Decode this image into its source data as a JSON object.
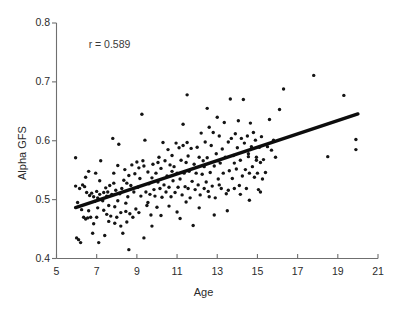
{
  "chart_data": {
    "type": "scatter",
    "title": "",
    "xlabel": "Age",
    "ylabel": "Alpha GFS",
    "xlim": [
      5,
      21
    ],
    "ylim": [
      0.4,
      0.8
    ],
    "xticks": [
      5,
      7,
      9,
      11,
      13,
      15,
      17,
      19,
      21
    ],
    "xtick_labels": [
      "5",
      "7",
      "9",
      "11",
      "13",
      "15",
      "17",
      "19",
      "21"
    ],
    "yticks": [
      0.4,
      0.5,
      0.6,
      0.7,
      0.8
    ],
    "ytick_labels": [
      "0.4",
      "0.5",
      "0.6",
      "0.7",
      "0.8"
    ],
    "grid": false,
    "legend": "none",
    "annotations": [
      {
        "text": "r = 0.589",
        "x": 6.6,
        "y": 0.762
      }
    ],
    "marker": {
      "shape": "circle",
      "color": "#141414",
      "size_px": 3.4
    },
    "trendline": {
      "type": "linear",
      "color": "#0d0d0d",
      "width_px": 3.4,
      "x_start": 5.95,
      "y_start": 0.4865,
      "x_end": 20.0,
      "y_end": 0.6455,
      "slope": 0.01131,
      "intercept": 0.4192
    },
    "spines": {
      "left": true,
      "bottom": true,
      "top": false,
      "right": false
    },
    "points": [
      [
        5.95,
        0.571
      ],
      [
        5.95,
        0.523
      ],
      [
        6.0,
        0.435
      ],
      [
        6.1,
        0.432
      ],
      [
        6.15,
        0.519
      ],
      [
        6.2,
        0.427
      ],
      [
        6.3,
        0.525
      ],
      [
        6.35,
        0.47
      ],
      [
        6.4,
        0.522
      ],
      [
        6.45,
        0.467
      ],
      [
        6.5,
        0.512
      ],
      [
        6.55,
        0.469
      ],
      [
        6.6,
        0.548
      ],
      [
        6.65,
        0.507
      ],
      [
        6.7,
        0.47
      ],
      [
        6.75,
        0.511
      ],
      [
        6.8,
        0.443
      ],
      [
        6.85,
        0.505
      ],
      [
        6.9,
        0.497
      ],
      [
        6.95,
        0.545
      ],
      [
        7.0,
        0.514
      ],
      [
        7.0,
        0.47
      ],
      [
        7.05,
        0.503
      ],
      [
        7.1,
        0.427
      ],
      [
        7.15,
        0.509
      ],
      [
        7.2,
        0.566
      ],
      [
        7.25,
        0.5
      ],
      [
        7.3,
        0.498
      ],
      [
        7.35,
        0.512
      ],
      [
        7.4,
        0.439
      ],
      [
        7.45,
        0.52
      ],
      [
        7.5,
        0.506
      ],
      [
        7.5,
        0.475
      ],
      [
        7.55,
        0.513
      ],
      [
        7.6,
        0.49
      ],
      [
        7.65,
        0.524
      ],
      [
        7.7,
        0.472
      ],
      [
        7.75,
        0.509
      ],
      [
        7.8,
        0.604
      ],
      [
        7.85,
        0.545
      ],
      [
        7.9,
        0.488
      ],
      [
        7.95,
        0.516
      ],
      [
        8.0,
        0.47
      ],
      [
        8.05,
        0.558
      ],
      [
        8.1,
        0.594
      ],
      [
        8.15,
        0.51
      ],
      [
        8.2,
        0.478
      ],
      [
        8.25,
        0.519
      ],
      [
        8.3,
        0.443
      ],
      [
        8.35,
        0.533
      ],
      [
        8.4,
        0.551
      ],
      [
        8.45,
        0.48
      ],
      [
        8.5,
        0.528
      ],
      [
        8.55,
        0.505
      ],
      [
        8.6,
        0.415
      ],
      [
        8.65,
        0.476
      ],
      [
        8.7,
        0.524
      ],
      [
        8.75,
        0.559
      ],
      [
        8.8,
        0.47
      ],
      [
        8.85,
        0.513
      ],
      [
        8.9,
        0.544
      ],
      [
        8.95,
        0.484
      ],
      [
        9.0,
        0.564
      ],
      [
        9.05,
        0.521
      ],
      [
        9.1,
        0.478
      ],
      [
        9.15,
        0.536
      ],
      [
        9.2,
        0.506
      ],
      [
        9.25,
        0.645
      ],
      [
        9.3,
        0.566
      ],
      [
        9.35,
        0.435
      ],
      [
        9.4,
        0.601
      ],
      [
        9.45,
        0.513
      ],
      [
        9.5,
        0.49
      ],
      [
        9.55,
        0.547
      ],
      [
        9.6,
        0.527
      ],
      [
        9.65,
        0.509
      ],
      [
        9.7,
        0.474
      ],
      [
        9.75,
        0.537
      ],
      [
        9.8,
        0.56
      ],
      [
        9.85,
        0.517
      ],
      [
        9.9,
        0.506
      ],
      [
        9.95,
        0.545
      ],
      [
        10.0,
        0.487
      ],
      [
        10.05,
        0.53
      ],
      [
        10.1,
        0.572
      ],
      [
        10.15,
        0.519
      ],
      [
        10.2,
        0.553
      ],
      [
        10.25,
        0.504
      ],
      [
        10.3,
        0.597
      ],
      [
        10.35,
        0.525
      ],
      [
        10.4,
        0.566
      ],
      [
        10.45,
        0.513
      ],
      [
        10.5,
        0.54
      ],
      [
        10.55,
        0.585
      ],
      [
        10.6,
        0.521
      ],
      [
        10.65,
        0.559
      ],
      [
        10.7,
        0.505
      ],
      [
        10.75,
        0.575
      ],
      [
        10.8,
        0.532
      ],
      [
        10.85,
        0.556
      ],
      [
        10.9,
        0.512
      ],
      [
        10.95,
        0.596
      ],
      [
        11.0,
        0.545
      ],
      [
        11.05,
        0.521
      ],
      [
        11.1,
        0.588
      ],
      [
        11.15,
        0.535
      ],
      [
        11.2,
        0.567
      ],
      [
        11.25,
        0.508
      ],
      [
        11.3,
        0.592
      ],
      [
        11.3,
        0.628
      ],
      [
        11.35,
        0.545
      ],
      [
        11.4,
        0.522
      ],
      [
        11.45,
        0.563
      ],
      [
        11.5,
        0.678
      ],
      [
        11.5,
        0.597
      ],
      [
        11.55,
        0.519
      ],
      [
        11.6,
        0.548
      ],
      [
        11.65,
        0.503
      ],
      [
        11.7,
        0.587
      ],
      [
        11.75,
        0.531
      ],
      [
        11.8,
        0.456
      ],
      [
        11.85,
        0.56
      ],
      [
        11.9,
        0.517
      ],
      [
        11.95,
        0.545
      ],
      [
        12.0,
        0.589
      ],
      [
        12.05,
        0.525
      ],
      [
        12.1,
        0.572
      ],
      [
        12.15,
        0.508
      ],
      [
        12.2,
        0.613
      ],
      [
        12.25,
        0.543
      ],
      [
        12.3,
        0.566
      ],
      [
        12.35,
        0.519
      ],
      [
        12.4,
        0.598
      ],
      [
        12.45,
        0.53
      ],
      [
        12.5,
        0.655
      ],
      [
        12.5,
        0.571
      ],
      [
        12.55,
        0.514
      ],
      [
        12.6,
        0.623
      ],
      [
        12.65,
        0.546
      ],
      [
        12.7,
        0.592
      ],
      [
        12.75,
        0.523
      ],
      [
        12.8,
        0.614
      ],
      [
        12.85,
        0.557
      ],
      [
        12.9,
        0.503
      ],
      [
        12.95,
        0.578
      ],
      [
        13.0,
        0.64
      ],
      [
        13.05,
        0.535
      ],
      [
        13.1,
        0.608
      ],
      [
        13.15,
        0.562
      ],
      [
        13.2,
        0.519
      ],
      [
        13.25,
        0.586
      ],
      [
        13.3,
        0.545
      ],
      [
        13.35,
        0.631
      ],
      [
        13.4,
        0.572
      ],
      [
        13.45,
        0.51
      ],
      [
        13.5,
        0.481
      ],
      [
        13.55,
        0.598
      ],
      [
        13.6,
        0.549
      ],
      [
        13.65,
        0.671
      ],
      [
        13.7,
        0.604
      ],
      [
        13.75,
        0.536
      ],
      [
        13.8,
        0.575
      ],
      [
        13.85,
        0.519
      ],
      [
        13.9,
        0.612
      ],
      [
        13.95,
        0.552
      ],
      [
        14.0,
        0.588
      ],
      [
        14.05,
        0.634
      ],
      [
        14.1,
        0.524
      ],
      [
        14.15,
        0.567
      ],
      [
        14.2,
        0.604
      ],
      [
        14.25,
        0.54
      ],
      [
        14.3,
        0.67
      ],
      [
        14.35,
        0.596
      ],
      [
        14.4,
        0.551
      ],
      [
        14.45,
        0.519
      ],
      [
        14.5,
        0.608
      ],
      [
        14.55,
        0.573
      ],
      [
        14.6,
        0.545
      ],
      [
        14.65,
        0.63
      ],
      [
        14.7,
        0.59
      ],
      [
        14.75,
        0.556
      ],
      [
        14.8,
        0.614
      ],
      [
        14.85,
        0.538
      ],
      [
        14.9,
        0.601
      ],
      [
        14.95,
        0.572
      ],
      [
        15.0,
        0.545
      ],
      [
        15.05,
        0.517
      ],
      [
        15.1,
        0.589
      ],
      [
        15.15,
        0.563
      ],
      [
        15.2,
        0.607
      ],
      [
        15.25,
        0.535
      ],
      [
        15.3,
        0.568
      ],
      [
        15.4,
        0.546
      ],
      [
        15.5,
        0.59
      ],
      [
        15.6,
        0.636
      ],
      [
        15.7,
        0.584
      ],
      [
        15.8,
        0.601
      ],
      [
        15.9,
        0.572
      ],
      [
        16.1,
        0.653
      ],
      [
        16.3,
        0.688
      ],
      [
        17.8,
        0.711
      ],
      [
        18.5,
        0.573
      ],
      [
        19.3,
        0.677
      ],
      [
        19.9,
        0.602
      ],
      [
        19.9,
        0.585
      ],
      [
        6.25,
        0.483
      ],
      [
        6.6,
        0.481
      ],
      [
        7.05,
        0.486
      ],
      [
        7.35,
        0.482
      ],
      [
        7.6,
        0.463
      ],
      [
        7.9,
        0.46
      ],
      [
        8.2,
        0.455
      ],
      [
        8.5,
        0.462
      ],
      [
        8.05,
        0.498
      ],
      [
        8.45,
        0.494
      ],
      [
        9.1,
        0.554
      ],
      [
        9.55,
        0.495
      ],
      [
        10.2,
        0.473
      ],
      [
        10.6,
        0.489
      ],
      [
        11.0,
        0.479
      ],
      [
        11.45,
        0.496
      ],
      [
        12.1,
        0.486
      ],
      [
        12.6,
        0.505
      ],
      [
        13.1,
        0.525
      ],
      [
        13.55,
        0.516
      ],
      [
        14.15,
        0.509
      ],
      [
        14.6,
        0.499
      ],
      [
        15.15,
        0.513
      ],
      [
        6.45,
        0.538
      ],
      [
        7.15,
        0.532
      ],
      [
        7.85,
        0.528
      ],
      [
        8.6,
        0.541
      ],
      [
        9.35,
        0.557
      ],
      [
        10.05,
        0.563
      ],
      [
        10.75,
        0.548
      ],
      [
        11.55,
        0.574
      ],
      [
        12.35,
        0.556
      ],
      [
        13.05,
        0.566
      ],
      [
        13.85,
        0.562
      ],
      [
        14.55,
        0.578
      ],
      [
        6.05,
        0.495
      ],
      [
        6.85,
        0.459
      ],
      [
        9.75,
        0.455
      ],
      [
        11.15,
        0.468
      ],
      [
        12.85,
        0.474
      ],
      [
        14.95,
        0.567
      ]
    ]
  }
}
